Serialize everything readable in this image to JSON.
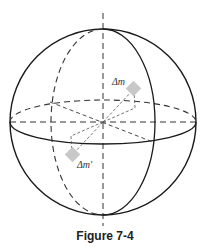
{
  "figure": {
    "caption": "Figure 7-4",
    "labels": {
      "mass_element": "Δm",
      "mass_element_prime": "Δm′"
    }
  },
  "colors": {
    "line": "#1a1a1a",
    "dashed_line": "#333333",
    "mass_fill": "#c8c8c8"
  }
}
